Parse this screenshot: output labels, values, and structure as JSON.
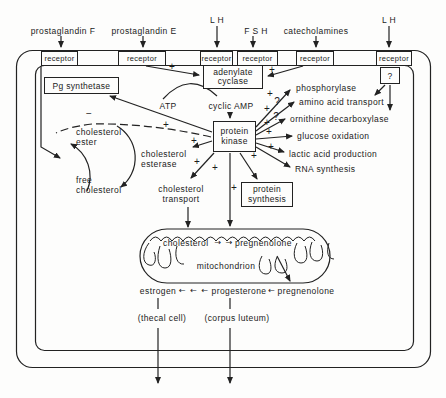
{
  "signs": {
    "plus": "+",
    "minus": "−",
    "question": "?"
  },
  "ligands": {
    "pgf": "prostaglandin F",
    "pge": "prostaglandin E",
    "lh_left": "L H",
    "fsh": "F S H",
    "catecholamines": "catecholamines",
    "lh_right": "L H"
  },
  "receptor_label": "receptor",
  "enzymes": {
    "pg_synthetase": "Pg synthetase",
    "adenylate_cyclase": "adenylate\ncyclase",
    "protein_kinase": "protein\nkinase",
    "protein_synthesis": "protein\nsynthesis",
    "unknown_mediator": "?"
  },
  "messengers": {
    "atp": "ATP",
    "cyclic_amp": "cyclic AMP"
  },
  "effects": [
    {
      "label": "phosphorylase"
    },
    {
      "label": "amino acid transport"
    },
    {
      "label": "ornithine decarboxylase"
    },
    {
      "label": "glucose oxidation"
    },
    {
      "label": "lactic acid production"
    },
    {
      "label": "RNA synthesis"
    }
  ],
  "cholesterol_cycle": {
    "ester": "cholesterol\nester",
    "free": "free\ncholesterol",
    "esterase": "cholesterol\nesterase",
    "transport": "cholesterol\ntransport"
  },
  "mitochondrion": {
    "name": "mitochondrion",
    "substrate": "cholesterol",
    "step_arrows": "→ →",
    "product": "pregnenolone"
  },
  "steroids": {
    "estrogen": "estrogen",
    "estrogen_arrows": "← ← ←",
    "progesterone": "progesterone",
    "pregnenolone_arrow": "←",
    "pregnenolone": "pregnenolone",
    "thecal": "(thecal cell)",
    "corpus": "(corpus luteum)"
  }
}
